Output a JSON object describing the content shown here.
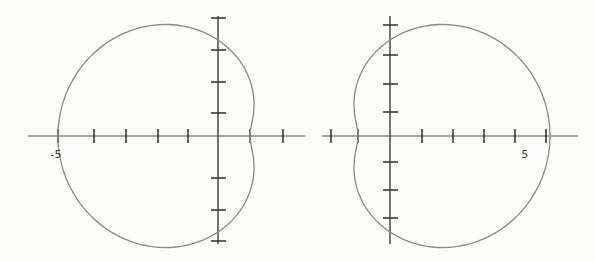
{
  "figure": {
    "name": "polar-curves-figure",
    "background_color": "#fdfdfc",
    "axis_color": "#3a3a3a",
    "curve_color": "#8a8a8a",
    "width": 595,
    "height": 262
  },
  "chart_data": [
    {
      "type": "line",
      "name": "left-plot",
      "title": "",
      "xlabel": "",
      "ylabel": "",
      "grid": false,
      "legend": null,
      "axes": {
        "origin_px": [
          218,
          136
        ],
        "unit_px": 32,
        "xlim": [
          -6.0,
          2.7
        ],
        "ylim": [
          -3.6,
          3.8
        ],
        "x_ticks": [
          -5,
          -4,
          -3,
          -2,
          -1,
          1,
          2
        ],
        "y_ticks": [
          -3,
          -2,
          -1,
          1,
          2,
          3
        ],
        "x_tick_labels": [
          "-5"
        ],
        "y_tick_labels": []
      },
      "annotations": [
        {
          "text": "-5",
          "x": -5,
          "y": 0,
          "placement": "below-axis"
        }
      ],
      "curve": {
        "description": "closed dimpled limacon opening to the left, r = 3 - 2cos(theta) reflected",
        "polar_equation": "r = 3 + 2*cos(theta), reflected through the y-axis",
        "a": 3,
        "b": 2,
        "orientation": "left",
        "x_extent": [
          -5.0,
          0.0
        ],
        "y_extent": [
          -3.1,
          3.1
        ],
        "dimple_x": -4.0,
        "points_theta_deg": [
          0,
          10,
          20,
          30,
          40,
          50,
          60,
          70,
          80,
          90,
          100,
          110,
          120,
          130,
          140,
          150,
          160,
          170,
          180,
          190,
          200,
          210,
          220,
          230,
          240,
          250,
          260,
          270,
          280,
          290,
          300,
          310,
          320,
          330,
          340,
          350,
          360
        ]
      }
    },
    {
      "type": "line",
      "name": "right-plot",
      "title": "",
      "xlabel": "",
      "ylabel": "",
      "grid": false,
      "legend": null,
      "axes": {
        "origin_px": [
          390,
          136
        ],
        "unit_px": 32,
        "xlim": [
          -2.1,
          6.3
        ],
        "ylim": [
          -3.6,
          3.8
        ],
        "x_ticks": [
          -2,
          -1,
          1,
          2,
          3,
          4,
          5
        ],
        "y_ticks": [
          -3,
          -2,
          -1,
          1,
          2,
          3
        ],
        "x_tick_labels": [
          "5"
        ],
        "y_tick_labels": []
      },
      "annotations": [
        {
          "text": "5",
          "x": 5,
          "y": 0,
          "placement": "below-axis"
        }
      ],
      "curve": {
        "description": "closed dimpled limacon opening to the right",
        "polar_equation": "r = 3 + 2*cos(theta)",
        "a": 3,
        "b": 2,
        "orientation": "right",
        "x_extent": [
          0.0,
          5.0
        ],
        "y_extent": [
          -3.1,
          3.1
        ],
        "dimple_x": 0.0,
        "points_theta_deg": [
          0,
          10,
          20,
          30,
          40,
          50,
          60,
          70,
          80,
          90,
          100,
          110,
          120,
          130,
          140,
          150,
          160,
          170,
          180,
          190,
          200,
          210,
          220,
          230,
          240,
          250,
          260,
          270,
          280,
          290,
          300,
          310,
          320,
          330,
          340,
          350,
          360
        ]
      }
    }
  ]
}
